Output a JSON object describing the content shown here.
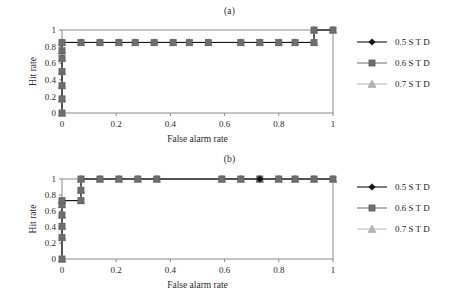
{
  "figure": {
    "background": "#ffffff",
    "panels": [
      {
        "caption": "(a)",
        "xlabel": "False alarm rate",
        "ylabel": "Hit rate",
        "xticks": [
          "0",
          "0.2",
          "0.4",
          "0.6",
          "0.8",
          "1"
        ],
        "yticks": [
          "0",
          "0.2",
          "0.4",
          "0.6",
          "0.8",
          "1"
        ]
      },
      {
        "caption": "(b)",
        "xlabel": "False alarm rate",
        "ylabel": "Hit rate",
        "xticks": [
          "0",
          "0.2",
          "0.4",
          "0.6",
          "0.8",
          "1"
        ],
        "yticks": [
          "0",
          "0.2",
          "0.4",
          "0.6",
          "0.8",
          "1"
        ]
      }
    ],
    "legend": {
      "entries": [
        {
          "label": "0.5 S T D",
          "marker": "diamond",
          "color": "#111111",
          "line_color": "#111111"
        },
        {
          "label": "0.6 S T D",
          "marker": "square",
          "color": "#6e6e6e",
          "line_color": "#7a7a7a"
        },
        {
          "label": "0.7 S T D",
          "marker": "triangle",
          "color": "#b3b3b3",
          "line_color": "#bdbdbd"
        }
      ]
    }
  },
  "chart_data": [
    {
      "type": "line",
      "title": "(a)",
      "xlabel": "False alarm rate",
      "ylabel": "Hit rate",
      "xlim": [
        0,
        1
      ],
      "ylim": [
        0,
        1
      ],
      "xticks": [
        0,
        0.2,
        0.4,
        0.6,
        0.8,
        1
      ],
      "yticks": [
        0,
        0.2,
        0.4,
        0.6,
        0.8,
        1
      ],
      "grid": false,
      "legend_position": "right",
      "series": [
        {
          "name": "0.5 S T D",
          "marker": "diamond",
          "color": "#111111",
          "x": [
            0,
            0,
            0,
            0,
            0,
            0,
            0,
            0.07,
            0.14,
            0.21,
            0.27,
            0.34,
            0.41,
            0.47,
            0.54,
            0.66,
            0.73,
            0.8,
            0.86,
            0.93,
            0.93,
            1.0
          ],
          "y": [
            0,
            0.17,
            0.33,
            0.5,
            0.66,
            0.75,
            0.85,
            0.85,
            0.85,
            0.85,
            0.85,
            0.85,
            0.85,
            0.85,
            0.85,
            0.85,
            0.85,
            0.85,
            0.85,
            0.85,
            1.0,
            1.0
          ]
        },
        {
          "name": "0.6 S T D",
          "marker": "square",
          "color": "#6e6e6e",
          "x": [
            0,
            0,
            0,
            0,
            0,
            0,
            0,
            0.07,
            0.14,
            0.21,
            0.27,
            0.34,
            0.41,
            0.47,
            0.54,
            0.66,
            0.73,
            0.8,
            0.86,
            0.93,
            0.93,
            1.0
          ],
          "y": [
            0,
            0.17,
            0.33,
            0.5,
            0.66,
            0.75,
            0.85,
            0.85,
            0.85,
            0.85,
            0.85,
            0.85,
            0.85,
            0.85,
            0.85,
            0.85,
            0.85,
            0.85,
            0.85,
            0.85,
            1.0,
            1.0
          ]
        },
        {
          "name": "0.7 S T D",
          "marker": "triangle",
          "color": "#b3b3b3",
          "x": [
            0,
            0,
            0,
            0,
            0,
            0,
            0,
            0.07,
            0.14,
            0.21,
            0.27,
            0.34,
            0.41,
            0.47,
            0.54,
            0.66,
            0.73,
            0.8,
            0.86,
            0.93,
            0.93,
            1.0
          ],
          "y": [
            0,
            0.17,
            0.33,
            0.5,
            0.66,
            0.75,
            0.85,
            0.85,
            0.85,
            0.85,
            0.85,
            0.85,
            0.85,
            0.85,
            0.85,
            0.85,
            0.85,
            0.85,
            0.85,
            0.85,
            1.0,
            1.0
          ]
        }
      ]
    },
    {
      "type": "line",
      "title": "(b)",
      "xlabel": "False alarm rate",
      "ylabel": "Hit rate",
      "xlim": [
        0,
        1
      ],
      "ylim": [
        0,
        1
      ],
      "xticks": [
        0,
        0.2,
        0.4,
        0.6,
        0.8,
        1
      ],
      "yticks": [
        0,
        0.2,
        0.4,
        0.6,
        0.8,
        1
      ],
      "grid": false,
      "legend_position": "right",
      "series": [
        {
          "name": "0.5 S T D",
          "marker": "diamond",
          "color": "#111111",
          "x": [
            0,
            0,
            0,
            0,
            0,
            0,
            0.07,
            0.07,
            0.07,
            0.14,
            0.21,
            0.28,
            0.35,
            0.59,
            0.66,
            0.73,
            0.8,
            0.86,
            0.93,
            1.0
          ],
          "y": [
            0,
            0.27,
            0.41,
            0.55,
            0.68,
            0.73,
            0.73,
            0.86,
            1.0,
            1.0,
            1.0,
            1.0,
            1.0,
            1.0,
            1.0,
            1.0,
            1.0,
            1.0,
            1.0,
            1.0
          ]
        },
        {
          "name": "0.6 S T D",
          "marker": "square",
          "color": "#6e6e6e",
          "x": [
            0,
            0,
            0,
            0,
            0,
            0,
            0.07,
            0.07,
            0.07,
            0.14,
            0.21,
            0.28,
            0.35,
            0.59,
            0.66,
            0.73,
            0.8,
            0.86,
            0.93,
            1.0
          ],
          "y": [
            0,
            0.27,
            0.41,
            0.55,
            0.68,
            0.73,
            0.73,
            0.86,
            1.0,
            1.0,
            1.0,
            1.0,
            1.0,
            1.0,
            1.0,
            1.0,
            1.0,
            1.0,
            1.0,
            1.0
          ]
        },
        {
          "name": "0.7 S T D",
          "marker": "triangle",
          "color": "#b3b3b3",
          "x": [
            0,
            0,
            0,
            0,
            0,
            0,
            0.07,
            0.07,
            0.07,
            0.14,
            0.21,
            0.28,
            0.35,
            0.59,
            0.66,
            0.73,
            0.8,
            0.86,
            0.93,
            1.0
          ],
          "y": [
            0,
            0.27,
            0.41,
            0.55,
            0.68,
            0.73,
            0.73,
            0.86,
            1.0,
            1.0,
            1.0,
            1.0,
            1.0,
            1.0,
            1.0,
            1.0,
            1.0,
            1.0,
            1.0,
            1.0
          ]
        }
      ]
    }
  ]
}
